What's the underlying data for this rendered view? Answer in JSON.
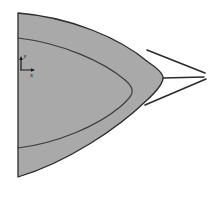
{
  "figure": {
    "width": 213,
    "height": 197,
    "background_color": "#ffffff"
  },
  "colors": {
    "fill_gray": "#a9a9a9",
    "stroke_dark": "#2b2b2b",
    "inner_curve": "#3a3a3a",
    "background": "#ffffff"
  },
  "axis_glyph": {
    "name": "coordinate-axes-marker",
    "origin_x": 21,
    "origin_y": 70,
    "y_label": "y",
    "x_label": "x",
    "y_arrow_length": 12,
    "x_arrow_length": 12
  },
  "shapes": {
    "outer_region": {
      "name": "shaded-parabolic-region",
      "fill": "#a9a9a9",
      "left_edge_x": 18,
      "top_y": 13,
      "bottom_y": 177,
      "apex_x": 163,
      "apex_y": 78
    },
    "inner_contour": {
      "name": "inner-contour-curve",
      "left_top_y": 38,
      "left_bottom_y": 148,
      "apex_x": 133,
      "apex_y": 93
    }
  },
  "lines": {
    "upper_ray": {
      "name": "upper-mach-line",
      "x1": 148,
      "y1": 51,
      "x2": 204,
      "y2": 73
    },
    "lower_ray": {
      "name": "lower-mach-line",
      "x1": 146,
      "y1": 104,
      "x2": 205,
      "y2": 79
    },
    "axis_ray": {
      "name": "horizontal-axis-line",
      "x1": 163,
      "y1": 78,
      "x2": 203,
      "y2": 77
    }
  }
}
